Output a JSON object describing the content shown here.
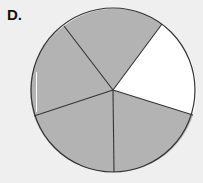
{
  "label": "D.",
  "figure": {
    "type": "fraction-circle",
    "total_parts": 5,
    "shaded_parts": 4,
    "unshaded_parts": 1,
    "shaded_color": "#b3b3b3",
    "unshaded_color": "#ffffff",
    "stroke_color": "#333333"
  }
}
